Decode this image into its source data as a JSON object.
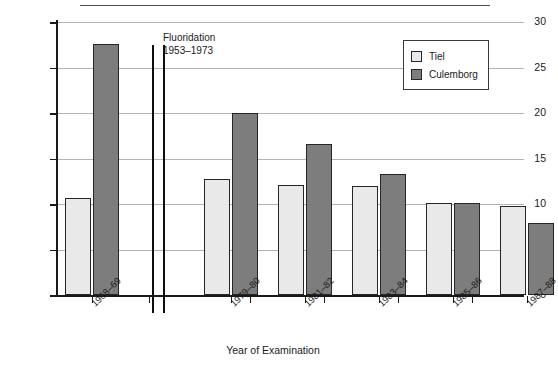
{
  "chart_data": {
    "type": "bar",
    "title": "",
    "xlabel": "Year of Examination",
    "ylabel": "Mean DMFS",
    "categories": [
      "1968–69",
      "1979–80",
      "1981–82",
      "1983–84",
      "1985–86",
      "1987–88"
    ],
    "series": [
      {
        "name": "Tiel",
        "color": "#e9e9e9",
        "values": [
          10.7,
          12.7,
          12.1,
          12.0,
          10.1,
          9.8
        ]
      },
      {
        "name": "Culemborg",
        "color": "#7d7d7d",
        "values": [
          27.6,
          20.0,
          16.6,
          13.3,
          10.1,
          7.9
        ]
      }
    ],
    "ylim": [
      0,
      30
    ],
    "yticks": [
      0,
      5,
      10,
      15,
      20,
      25,
      30
    ],
    "ytick_labels": [
      "0",
      "5",
      "10",
      "15",
      "20",
      "25",
      "30"
    ],
    "grid": true,
    "legend_position": "top-right",
    "annotations": [
      {
        "name": "fluoridation-period",
        "line1": "Fluoridation",
        "line2": "1953–1973"
      }
    ]
  },
  "legend": {
    "entries": [
      {
        "label": "Tiel"
      },
      {
        "label": "Culemborg"
      }
    ]
  }
}
